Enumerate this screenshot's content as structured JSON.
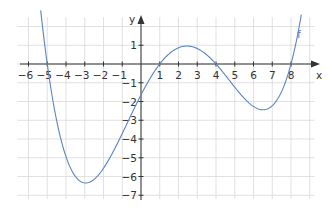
{
  "chart_data": {
    "type": "line",
    "title": "",
    "xlabel": "x",
    "ylabel": "y",
    "xlim": [
      -6.5,
      9.2
    ],
    "ylim": [
      -7.3,
      2.5
    ],
    "grid": true,
    "x_ticks": [
      -6,
      -5,
      -4,
      -3,
      -2,
      -1,
      1,
      2,
      3,
      4,
      5,
      6,
      7,
      8
    ],
    "y_ticks": [
      1,
      -1,
      -2,
      -3,
      -4,
      -5,
      -6,
      -7
    ],
    "x_tick_labels": [
      "−6",
      "−5",
      "−4",
      "−3",
      "−2",
      "−1",
      "1",
      "2",
      "3",
      "4",
      "5",
      "6",
      "7",
      "8"
    ],
    "y_tick_labels": [
      "1",
      "−1",
      "−2",
      "−3",
      "−4",
      "−5",
      "−6",
      "−7"
    ],
    "series": [
      {
        "name": "f",
        "description": "quartic with roots at -5, 1, 4, 8",
        "roots": [
          -5,
          1,
          4,
          8
        ],
        "local_min_1": [
          -3,
          -6.2
        ],
        "local_max": [
          2.5,
          0.9
        ],
        "local_min_2": [
          6.6,
          -2.4
        ],
        "y_intercept": -1.7,
        "x": [
          -5.6,
          -5,
          -4,
          -3,
          -2,
          -1,
          0,
          1,
          2,
          2.5,
          3,
          4,
          5,
          6,
          6.6,
          7,
          8,
          8.7
        ],
        "y": [
          4.8,
          0,
          -4.4,
          -6.3,
          -5.8,
          -4.0,
          -1.7,
          0,
          0.8,
          0.9,
          0.8,
          0,
          -1.3,
          -2.3,
          -2.4,
          -2.2,
          0,
          2.5
        ]
      }
    ],
    "legend": [],
    "annotations": [
      "f"
    ]
  },
  "labels": {
    "x_axis": "x",
    "y_axis": "y",
    "function": "f"
  },
  "colors": {
    "curve": "#5b84bf",
    "grid": "#d9d9d9",
    "axis": "#333333"
  }
}
